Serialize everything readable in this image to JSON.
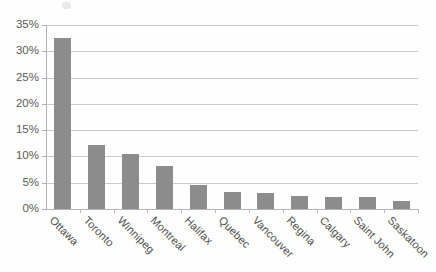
{
  "chart_data": {
    "type": "bar",
    "title": "",
    "subtitle": "",
    "xlabel": "",
    "ylabel": "",
    "categories": [
      "Ottawa",
      "Toronto",
      "Winnipeg",
      "Montreal",
      "Halifax",
      "Quebec",
      "Vancouver",
      "Regina",
      "Calgary",
      "Saint John",
      "Saskatoon"
    ],
    "values": [
      32.5,
      12.2,
      10.4,
      8.2,
      4.6,
      3.3,
      3.1,
      2.4,
      2.2,
      2.2,
      1.5
    ],
    "ylim": [
      0,
      35
    ],
    "ytick_values": [
      0,
      5,
      10,
      15,
      20,
      25,
      30,
      35
    ],
    "ytick_labels": [
      "0%",
      "5%",
      "10%",
      "15%",
      "20%",
      "25%",
      "30%",
      "35%"
    ],
    "grid": true,
    "legend": null,
    "legend_position": "none",
    "bar_color": "#8c8c8c",
    "gridline_color": "#c9c9c9",
    "axis_color": "#b0b0b0",
    "label_color": "#5a5a5a",
    "orientation": "vertical",
    "annotations": []
  }
}
